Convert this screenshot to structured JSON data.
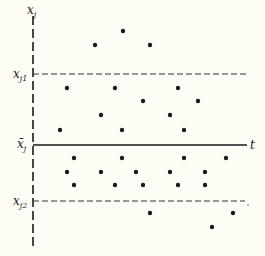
{
  "diagram": {
    "type": "control-chart-scatter",
    "background": "#fdfdf6",
    "ink": "#1a1a1a",
    "axis": {
      "vertical_label": "x",
      "vertical_label_sub": "j",
      "horizontal_label": "t"
    },
    "reference_lines": [
      {
        "name": "upper-limit",
        "label": "x",
        "sub": "j1",
        "y": 74,
        "style": "dashed"
      },
      {
        "name": "mean",
        "label": "x̄",
        "sub": "j",
        "y": 145,
        "style": "solid"
      },
      {
        "name": "lower-limit",
        "label": "x",
        "sub": "j2",
        "y": 201,
        "style": "dashed"
      }
    ],
    "points": [
      [
        95,
        45
      ],
      [
        123,
        31
      ],
      [
        150,
        45
      ],
      [
        67,
        88
      ],
      [
        115,
        88
      ],
      [
        178,
        88
      ],
      [
        143,
        101
      ],
      [
        198,
        101
      ],
      [
        101,
        115
      ],
      [
        170,
        115
      ],
      [
        60,
        130
      ],
      [
        122,
        130
      ],
      [
        184,
        130
      ],
      [
        74,
        158
      ],
      [
        122,
        158
      ],
      [
        184,
        158
      ],
      [
        226,
        158
      ],
      [
        67,
        172
      ],
      [
        101,
        172
      ],
      [
        136,
        172
      ],
      [
        170,
        172
      ],
      [
        205,
        172
      ],
      [
        74,
        185
      ],
      [
        115,
        185
      ],
      [
        143,
        185
      ],
      [
        178,
        185
      ],
      [
        205,
        185
      ],
      [
        150,
        213
      ],
      [
        233,
        213
      ],
      [
        212,
        227
      ]
    ]
  }
}
